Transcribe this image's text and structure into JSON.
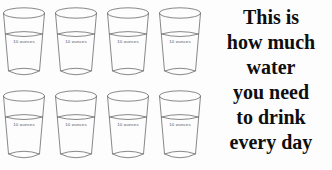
{
  "poster": {
    "background_color": "#fdfdfd",
    "glass_line_color": "#6a6a6d",
    "text_color": "#0e0e0e",
    "label_color": "#58585a"
  },
  "glasses": {
    "rows": 2,
    "columns": 4,
    "total_count": 8,
    "unit_label": "10 ounces",
    "items": [
      {
        "label": "10 ounces"
      },
      {
        "label": "10 ounces"
      },
      {
        "label": "10 ounces"
      },
      {
        "label": "10 ounces"
      },
      {
        "label": "10 ounces"
      },
      {
        "label": "10 ounces"
      },
      {
        "label": "10 ounces"
      },
      {
        "label": "10 ounces"
      }
    ]
  },
  "caption": {
    "lines": [
      "This is",
      "how much",
      "water",
      "you need",
      "to drink",
      "every day"
    ],
    "full_text": "This is how much water you need to drink every day"
  }
}
